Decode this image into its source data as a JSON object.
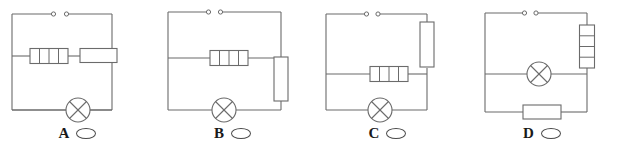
{
  "figure": {
    "name": "multiple-choice-circuit-diagrams",
    "width": 619,
    "height": 146,
    "background_color": "#ffffff",
    "line_color": "#6b6b6b",
    "label_color": "#1a1a1a"
  },
  "options": [
    {
      "letter": "A",
      "bubble": "answer-bubble-a",
      "components": [
        {
          "name": "open-switch",
          "type": "switch",
          "orientation": "horizontal",
          "position": "top-branch"
        },
        {
          "name": "segmented-resistor",
          "type": "resistor-segmented",
          "cells": 4,
          "orientation": "horizontal",
          "position": "middle-branch-left"
        },
        {
          "name": "plain-resistor",
          "type": "resistor-plain",
          "orientation": "horizontal",
          "position": "middle-branch-right"
        },
        {
          "name": "lamp",
          "type": "lamp",
          "position": "bottom-branch"
        }
      ]
    },
    {
      "letter": "B",
      "bubble": "answer-bubble-b",
      "components": [
        {
          "name": "open-switch",
          "type": "switch",
          "orientation": "horizontal",
          "position": "top-branch"
        },
        {
          "name": "segmented-resistor",
          "type": "resistor-segmented",
          "cells": 4,
          "orientation": "horizontal",
          "position": "middle-branch"
        },
        {
          "name": "plain-resistor",
          "type": "resistor-plain",
          "orientation": "vertical",
          "position": "right-side-lower"
        },
        {
          "name": "lamp",
          "type": "lamp",
          "position": "bottom-branch"
        }
      ]
    },
    {
      "letter": "C",
      "bubble": "answer-bubble-c",
      "components": [
        {
          "name": "open-switch",
          "type": "switch",
          "orientation": "horizontal",
          "position": "top-branch"
        },
        {
          "name": "plain-resistor",
          "type": "resistor-plain",
          "orientation": "vertical",
          "position": "right-side-upper"
        },
        {
          "name": "segmented-resistor",
          "type": "resistor-segmented",
          "cells": 4,
          "orientation": "horizontal",
          "position": "middle-branch"
        },
        {
          "name": "lamp",
          "type": "lamp",
          "position": "bottom-branch"
        }
      ]
    },
    {
      "letter": "D",
      "bubble": "answer-bubble-d",
      "components": [
        {
          "name": "open-switch",
          "type": "switch",
          "orientation": "horizontal",
          "position": "top-branch"
        },
        {
          "name": "segmented-resistor",
          "type": "resistor-segmented",
          "cells": 4,
          "orientation": "vertical",
          "position": "right-side-upper"
        },
        {
          "name": "lamp",
          "type": "lamp",
          "position": "middle-branch"
        },
        {
          "name": "plain-resistor",
          "type": "resistor-plain",
          "orientation": "horizontal",
          "position": "bottom-branch"
        }
      ]
    }
  ]
}
